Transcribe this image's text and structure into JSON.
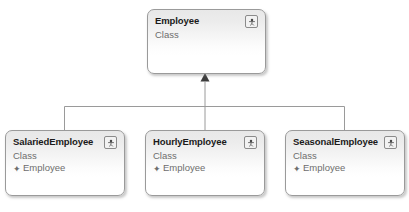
{
  "diagram": {
    "type": "uml-class-diagram",
    "background_color": "#ffffff",
    "relationship": "generalization",
    "base_class": "Employee",
    "stereotype_label": "Class",
    "inheritance_marker": "✦",
    "icon_name": "class-icon",
    "line_color": "#9a9a9a",
    "border_color": "#9a9a9a",
    "title_color": "#1a1a1a",
    "subtitle_color": "#6d6d6d"
  },
  "classes": {
    "employee": {
      "name": "Employee",
      "stereotype": "Class",
      "base": ""
    },
    "salaried": {
      "name": "SalariedEmployee",
      "stereotype": "Class",
      "base": "Employee"
    },
    "hourly": {
      "name": "HourlyEmployee",
      "stereotype": "Class",
      "base": "Employee"
    },
    "seasonal": {
      "name": "SeasonalEmployee",
      "stereotype": "Class",
      "base": "Employee"
    }
  }
}
